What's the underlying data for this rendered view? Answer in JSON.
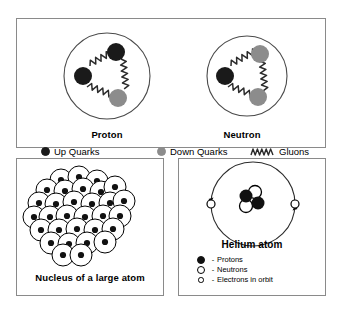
{
  "figure": {
    "type": "diagram"
  },
  "panels": {
    "particles": {
      "proton": {
        "caption": "Proton",
        "quarks": [
          {
            "type": "up",
            "label": "up quark",
            "color": "#1a1a1a",
            "cx": 44,
            "cy": 26,
            "r": 9
          },
          {
            "type": "up",
            "label": "up quark",
            "color": "#1a1a1a",
            "cx": 18,
            "cy": 46,
            "r": 9
          },
          {
            "type": "down",
            "label": "down quark",
            "color": "#8c8c8c",
            "cx": 44,
            "cy": 66,
            "r": 9
          }
        ],
        "shell": {
          "cx": 35,
          "cy": 45,
          "r": 41
        }
      },
      "neutron": {
        "caption": "Neutron",
        "quarks": [
          {
            "type": "down",
            "label": "down quark",
            "color": "#8c8c8c",
            "cx": 44,
            "cy": 26,
            "r": 9
          },
          {
            "type": "up",
            "label": "up quark",
            "color": "#1a1a1a",
            "cx": 18,
            "cy": 46,
            "r": 9
          },
          {
            "type": "down",
            "label": "down quark",
            "color": "#8c8c8c",
            "cx": 44,
            "cy": 66,
            "r": 9
          }
        ],
        "shell": {
          "cx": 35,
          "cy": 45,
          "r": 38
        }
      },
      "legend": {
        "up_quarks": "Up Quarks",
        "down_quarks": "Down Quarks",
        "gluons": "Gluons"
      }
    },
    "nucleus": {
      "caption": "Nucleus of a large atom",
      "nucleon_count": 31,
      "nucleons": [
        {
          "cx": 44,
          "cy": 21
        },
        {
          "cx": 62,
          "cy": 18
        },
        {
          "cx": 80,
          "cy": 22
        },
        {
          "cx": 30,
          "cy": 31
        },
        {
          "cx": 48,
          "cy": 32
        },
        {
          "cx": 66,
          "cy": 30
        },
        {
          "cx": 84,
          "cy": 33
        },
        {
          "cx": 98,
          "cy": 28
        },
        {
          "cx": 22,
          "cy": 44
        },
        {
          "cx": 39,
          "cy": 45
        },
        {
          "cx": 57,
          "cy": 43
        },
        {
          "cx": 75,
          "cy": 45
        },
        {
          "cx": 93,
          "cy": 44
        },
        {
          "cx": 107,
          "cy": 42
        },
        {
          "cx": 17,
          "cy": 58
        },
        {
          "cx": 33,
          "cy": 58
        },
        {
          "cx": 50,
          "cy": 57
        },
        {
          "cx": 68,
          "cy": 58
        },
        {
          "cx": 86,
          "cy": 57
        },
        {
          "cx": 103,
          "cy": 57
        },
        {
          "cx": 24,
          "cy": 71
        },
        {
          "cx": 42,
          "cy": 71
        },
        {
          "cx": 60,
          "cy": 70
        },
        {
          "cx": 78,
          "cy": 71
        },
        {
          "cx": 96,
          "cy": 70
        },
        {
          "cx": 34,
          "cy": 84
        },
        {
          "cx": 52,
          "cy": 85
        },
        {
          "cx": 70,
          "cy": 84
        },
        {
          "cx": 88,
          "cy": 83
        },
        {
          "cx": 46,
          "cy": 96
        },
        {
          "cx": 64,
          "cy": 96
        }
      ]
    },
    "helium": {
      "caption": "Helium atom",
      "orbit": {
        "cx": 74,
        "cy": 45,
        "r": 42
      },
      "nucleus_particles": [
        {
          "type": "proton",
          "cx": 68,
          "cy": 38
        },
        {
          "type": "neutron",
          "cx": 77,
          "cy": 33
        },
        {
          "type": "neutron",
          "cx": 68,
          "cy": 48
        },
        {
          "type": "proton",
          "cx": 79,
          "cy": 45
        }
      ],
      "electrons": [
        {
          "cx": 32,
          "cy": 45
        },
        {
          "cx": 116,
          "cy": 45
        }
      ],
      "legend": {
        "dash": "-",
        "protons": "Protons",
        "neutrons": "Neutrons",
        "electrons": "Electrons in orbit"
      }
    }
  },
  "colors": {
    "up_quark": "#1a1a1a",
    "down_quark": "#8c8c8c",
    "panel_border": "#8a8a8a",
    "stroke": "#000000",
    "background": "#ffffff"
  }
}
